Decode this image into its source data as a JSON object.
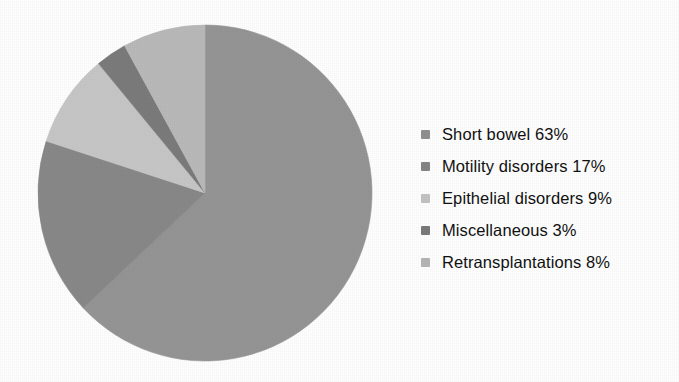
{
  "chart_data": {
    "type": "pie",
    "title": "",
    "subtitle": "",
    "xlabel": "",
    "ylabel": "",
    "grid": false,
    "legend_position": "right",
    "start_angle_deg": 0,
    "direction": "clockwise",
    "units": "percent",
    "categories": [
      "Short bowel",
      "Motility disorders",
      "Epithelial disorders",
      "Miscellaneous",
      "Retransplantations"
    ],
    "values": [
      63,
      17,
      9,
      3,
      8
    ],
    "labels": [
      "Short bowel 63%",
      "Motility disorders 17%",
      "Epithelial disorders 9%",
      "Miscellaneous 3%",
      "Retransplantations 8%"
    ],
    "colors": [
      "#959595",
      "#888888",
      "#c6c6c6",
      "#7b7b7b",
      "#b9b9b9"
    ],
    "slices": [
      {
        "name": "Short bowel",
        "value": 63,
        "label": "Short bowel 63%",
        "color": "#959595",
        "start_deg": 0.0,
        "sweep_deg": 226.8
      },
      {
        "name": "Motility disorders",
        "value": 17,
        "label": "Motility disorders 17%",
        "color": "#888888",
        "start_deg": 226.8,
        "sweep_deg": 61.2
      },
      {
        "name": "Epithelial disorders",
        "value": 9,
        "label": "Epithelial disorders 9%",
        "color": "#c6c6c6",
        "start_deg": 288.0,
        "sweep_deg": 32.4
      },
      {
        "name": "Miscellaneous",
        "value": 3,
        "label": "Miscellaneous 3%",
        "color": "#7b7b7b",
        "start_deg": 320.4,
        "sweep_deg": 10.8
      },
      {
        "name": "Retransplantations",
        "value": 8,
        "label": "Retransplantations 8%",
        "color": "#b9b9b9",
        "start_deg": 331.2,
        "sweep_deg": 28.8
      }
    ]
  },
  "legend": {
    "items": [
      {
        "label": "Short bowel 63%",
        "swatch_color": "#8f8f8f"
      },
      {
        "label": "Motility disorders 17%",
        "swatch_color": "#858585"
      },
      {
        "label": "Epithelial disorders 9%",
        "swatch_color": "#c2c2c2"
      },
      {
        "label": "Miscellaneous 3%",
        "swatch_color": "#7a7a7a"
      },
      {
        "label": "Retransplantations 8%",
        "swatch_color": "#b5b5b5"
      }
    ]
  },
  "figure": {
    "background_color": "#ffffff",
    "pie": {
      "center_x": 205,
      "center_y": 193,
      "radius_x": 167,
      "radius_y": 168
    }
  }
}
